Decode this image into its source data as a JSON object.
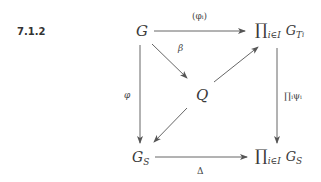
{
  "equation_number": "7.1.2",
  "nodes": {
    "G": "G",
    "Q": "Q",
    "top_right": {
      "prod": "∏",
      "index": "i∈I",
      "base": "G",
      "sub": "T",
      "subsub": "i"
    },
    "G_S": {
      "base": "G",
      "sub": "S"
    },
    "bottom_right": {
      "prod": "∏",
      "index": "i∈I",
      "base": "G",
      "sub": "S"
    }
  },
  "arrows": {
    "top": {
      "from": "G",
      "to": "∏_{i∈I} G_{T_i}",
      "label": "(φᵢ)"
    },
    "left": {
      "from": "G",
      "to": "G_S",
      "label": "φ"
    },
    "diag_beta": {
      "from": "G",
      "to": "Q",
      "label": "β"
    },
    "diag_q_top": {
      "from": "Q",
      "to": "∏_{i∈I} G_{T_i}",
      "label": ""
    },
    "diag_q_gs": {
      "from": "Q",
      "to": "G_S",
      "label": ""
    },
    "right": {
      "from": "∏_{i∈I} G_{T_i}",
      "to": "∏_{i∈I} G_S",
      "label": "∏ᵢψᵢ"
    },
    "bottom": {
      "from": "G_S",
      "to": "∏_{i∈I} G_S",
      "label": "Δ"
    }
  },
  "colors": {
    "ink": "#3a3a3a",
    "background": "#ffffff"
  }
}
